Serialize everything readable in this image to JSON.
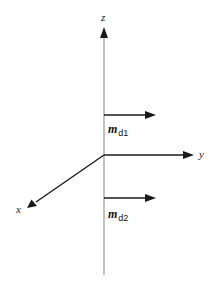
{
  "diagram": {
    "type": "3d-coordinate-axes",
    "origin": {
      "x": 104,
      "y": 155
    },
    "axes": {
      "z": {
        "label": "z",
        "direction": "up",
        "color": "#999999"
      },
      "y": {
        "label": "y",
        "direction": "right",
        "color": "#222222"
      },
      "x": {
        "label": "x",
        "direction": "down-left",
        "color": "#222222"
      }
    },
    "vectors": [
      {
        "id": "md1",
        "symbol": "m",
        "subscript": "d1",
        "direction": "+y",
        "position": "above origin on z-axis"
      },
      {
        "id": "md2",
        "symbol": "m",
        "subscript": "d2",
        "direction": "+y",
        "position": "below origin on z-axis"
      }
    ],
    "colors": {
      "z_axis": "#9a9a9a",
      "arrows": "#1a1a1a",
      "background": "#ffffff"
    }
  }
}
